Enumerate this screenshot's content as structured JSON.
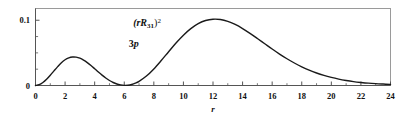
{
  "chart_data": {
    "type": "line",
    "title": "",
    "xlabel": "r",
    "ylabel": "",
    "xlim": [
      0,
      24
    ],
    "ylim": [
      0,
      0.118
    ],
    "grid": false,
    "legend": false,
    "annotations": [
      {
        "text": "(rR31)^2",
        "x": 6.6,
        "y": 0.104
      },
      {
        "text": "3p",
        "x": 6.3,
        "y": 0.072
      }
    ],
    "xticks": [
      0,
      2,
      4,
      6,
      8,
      10,
      12,
      14,
      16,
      18,
      20,
      22,
      24
    ],
    "xtick_labels": [
      "0",
      "2",
      "4",
      "6",
      "8",
      "10",
      "12",
      "14",
      "16",
      "18",
      "20",
      "22",
      "24"
    ],
    "xminor_ticks": [
      1,
      3,
      5,
      7,
      9,
      11,
      13,
      15,
      17,
      19,
      21,
      23
    ],
    "yticks": [
      0,
      0.1
    ],
    "ytick_labels": [
      "0",
      "0.1"
    ],
    "yminor_ticks": [
      0.025,
      0.05,
      0.075
    ],
    "series": [
      {
        "name": "(rR31)^2",
        "color": "#1a1a1a",
        "linewidth": 1.4,
        "x": [
          0.0,
          0.25,
          0.5,
          0.75,
          1.0,
          1.25,
          1.5,
          1.75,
          2.0,
          2.25,
          2.5,
          2.75,
          3.0,
          3.25,
          3.5,
          3.75,
          4.0,
          4.25,
          4.5,
          4.75,
          5.0,
          5.25,
          5.5,
          5.75,
          6.0,
          6.25,
          6.5,
          6.75,
          7.0,
          7.5,
          8.0,
          8.5,
          9.0,
          9.5,
          10.0,
          10.5,
          11.0,
          11.5,
          12.0,
          12.5,
          13.0,
          13.5,
          14.0,
          14.5,
          15.0,
          15.5,
          16.0,
          16.5,
          17.0,
          17.5,
          18.0,
          18.5,
          19.0,
          19.5,
          20.0,
          20.5,
          21.0,
          21.5,
          22.0,
          22.5,
          23.0,
          23.5,
          24.0
        ],
        "y": [
          0.0,
          0.0012,
          0.0046,
          0.0096,
          0.0157,
          0.0224,
          0.0289,
          0.0348,
          0.0394,
          0.0423,
          0.0436,
          0.0434,
          0.0418,
          0.0389,
          0.0351,
          0.0306,
          0.0257,
          0.0207,
          0.0159,
          0.0115,
          0.0077,
          0.0046,
          0.0023,
          0.0009,
          0.0002,
          0.0004,
          0.0015,
          0.0035,
          0.0064,
          0.0145,
          0.0254,
          0.0382,
          0.0518,
          0.0651,
          0.0771,
          0.0871,
          0.0947,
          0.0996,
          0.1016,
          0.1011,
          0.0983,
          0.0935,
          0.0873,
          0.08,
          0.0721,
          0.064,
          0.0559,
          0.0482,
          0.041,
          0.0345,
          0.0287,
          0.0236,
          0.0192,
          0.0155,
          0.0124,
          0.0098,
          0.0077,
          0.006,
          0.0047,
          0.0036,
          0.0028,
          0.0022,
          0.0017
        ]
      }
    ]
  },
  "figure": {
    "frame_color": "#9a9a9a",
    "axis_color": "#555555",
    "text_color": "#111111"
  }
}
